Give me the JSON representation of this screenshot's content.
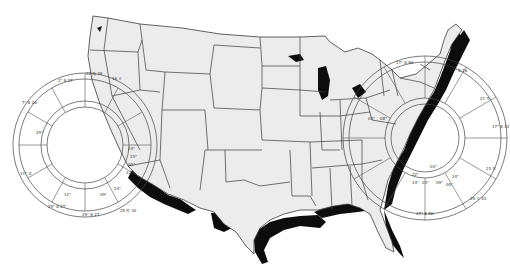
{
  "figure": {
    "title": "",
    "colors": {
      "background": "#ffffff",
      "land": "#ececec",
      "borders": "#3a3a3a",
      "shadow": "#0d0d0d"
    }
  },
  "charts": {
    "west": {
      "cusp_labels": [
        "2° 8 27",
        "7° 8 26",
        "22 ♍ 39",
        "16 ♌",
        "18 ♋ 38",
        "11° ♊",
        "29° 8 27",
        "25 ♏ 30",
        "22 ♉ 39",
        "16 ♒"
      ],
      "planet_labels": [
        "24°",
        "23°",
        "00°",
        "12°",
        "29°",
        "24°",
        "09°",
        "12°",
        "27°"
      ]
    },
    "east": {
      "cusp_labels": [
        "17° 8 16",
        "21 ♋",
        "17° 8 43",
        "23 ♋",
        "25 ♌ 43",
        "17° 8 56",
        "23 ♑",
        "17° 8 56"
      ],
      "planet_labels": [
        "03°",
        "22°",
        "09°",
        "24°",
        "14°",
        "23°",
        "00°",
        "03°",
        "08°"
      ]
    }
  }
}
